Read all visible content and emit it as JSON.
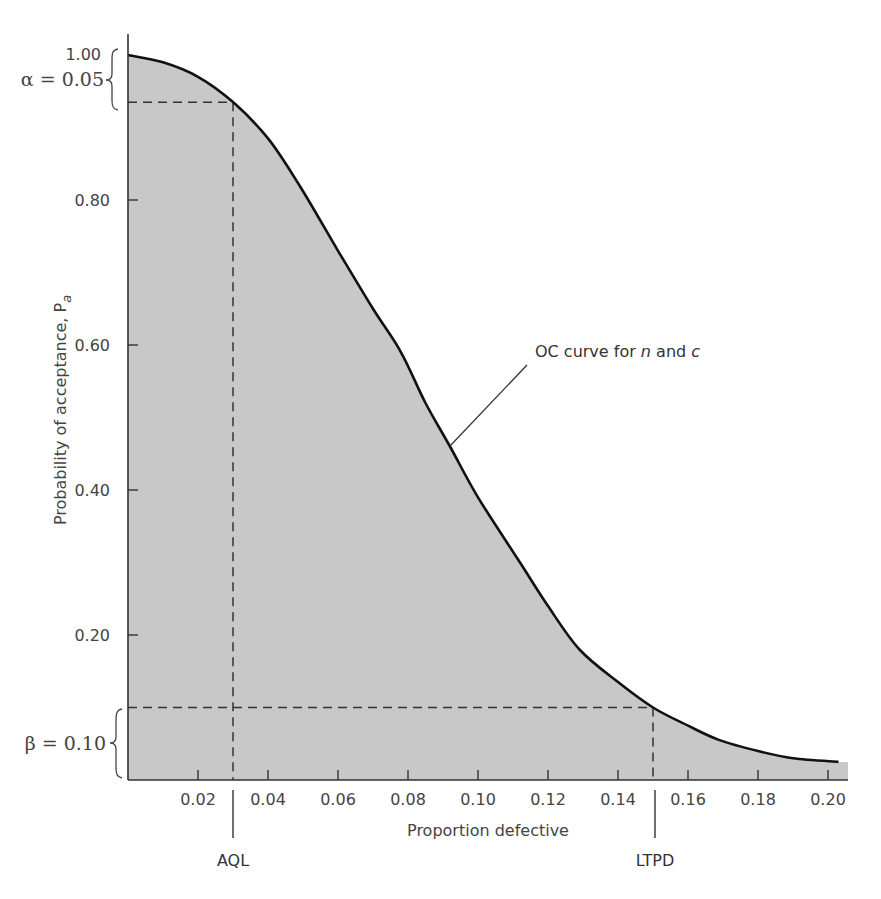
{
  "chart_data": {
    "type": "area",
    "title": "",
    "xlabel": "Proportion defective",
    "ylabel": "Probability of acceptance, P",
    "ylabel_subscript": "a",
    "xlim": [
      0,
      0.206
    ],
    "ylim": [
      0,
      1.0
    ],
    "grid": false,
    "x_ticks": [
      0.02,
      0.04,
      0.06,
      0.08,
      0.1,
      0.12,
      0.14,
      0.16,
      0.18,
      0.2
    ],
    "x_tick_labels": [
      "0.02",
      "0.04",
      "0.06",
      "0.08",
      "0.10",
      "0.12",
      "0.14",
      "0.16",
      "0.18",
      "0.20"
    ],
    "y_ticks": [
      0.2,
      0.4,
      0.6,
      0.8,
      1.0
    ],
    "y_tick_labels": [
      "0.20",
      "0.40",
      "0.60",
      "0.80",
      "1.00"
    ],
    "series": [
      {
        "name": "OC curve for n and c",
        "x": [
          0.0,
          0.01,
          0.02,
          0.03,
          0.04,
          0.049,
          0.06,
          0.07,
          0.078,
          0.085,
          0.092,
          0.1,
          0.112,
          0.12,
          0.129,
          0.14,
          0.15,
          0.16,
          0.169,
          0.18,
          0.19,
          0.203
        ],
        "y": [
          1.0,
          0.99,
          0.97,
          0.935,
          0.885,
          0.82,
          0.73,
          0.65,
          0.59,
          0.52,
          0.46,
          0.39,
          0.3,
          0.24,
          0.18,
          0.135,
          0.1,
          0.075,
          0.055,
          0.04,
          0.03,
          0.025
        ]
      }
    ],
    "annotations": {
      "alpha": {
        "symbol": "α",
        "label": "α = 0.05",
        "value": 0.05
      },
      "beta": {
        "symbol": "β",
        "label": "β = 0.10",
        "value": 0.1
      },
      "AQL": {
        "label": "AQL",
        "x": 0.03,
        "y": 0.935
      },
      "LTPD": {
        "label": "LTPD",
        "x": 0.15,
        "y": 0.1
      },
      "curve_label": {
        "text_prefix": "OC curve for ",
        "n": "n",
        "and": " and ",
        "c": "c"
      }
    },
    "fill_color": "#c8c8c8",
    "curve_color": "#111111",
    "dash_color": "#333333"
  }
}
